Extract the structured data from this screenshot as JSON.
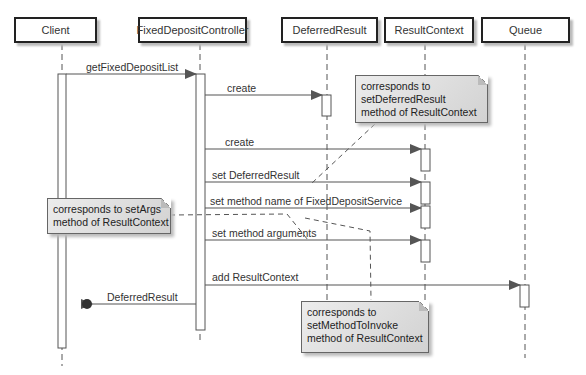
{
  "participants": [
    {
      "name": "Client"
    },
    {
      "name": "FixedDepositController"
    },
    {
      "name": "DeferredResult"
    },
    {
      "name": "ResultContext"
    },
    {
      "name": "Queue"
    }
  ],
  "messages": [
    {
      "label": "getFixedDepositList",
      "from": "Client",
      "to": "FixedDepositController"
    },
    {
      "label": "create",
      "from": "FixedDepositController",
      "to": "DeferredResult"
    },
    {
      "label": "create",
      "from": "FixedDepositController",
      "to": "ResultContext"
    },
    {
      "label": "set DeferredResult",
      "from": "FixedDepositController",
      "to": "ResultContext"
    },
    {
      "label": "set method name of FixedDepositService",
      "from": "FixedDepositController",
      "to": "ResultContext"
    },
    {
      "label": "set method arguments",
      "from": "FixedDepositController",
      "to": "ResultContext"
    },
    {
      "label": "add ResultContext",
      "from": "FixedDepositController",
      "to": "Queue"
    },
    {
      "label": "DeferredResult",
      "from": "FixedDepositController",
      "to": "Client",
      "type": "return-lost-found"
    }
  ],
  "notes": [
    {
      "lines": [
        "corresponds to",
        "setDeferredResult",
        "method of ResultContext"
      ]
    },
    {
      "lines": [
        "corresponds to setArgs",
        "method of ResultContext"
      ]
    },
    {
      "lines": [
        "corresponds to",
        "setMethodToInvoke",
        "method of ResultContext"
      ]
    }
  ],
  "colors": {
    "line": "#555555",
    "arrowhead": "#555555",
    "note_fill": "#dcdcdc",
    "box_border": "#222222"
  }
}
